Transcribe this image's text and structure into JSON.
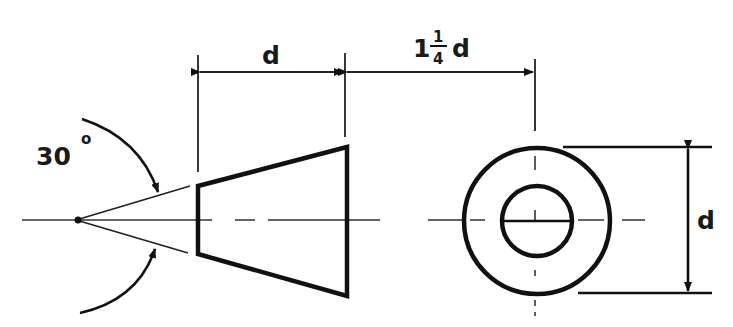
{
  "figure": {
    "labels": {
      "angle": "30",
      "angle_unit": "o",
      "length_dim": "d",
      "offset_whole": "1",
      "offset_num": "1",
      "offset_den": "4",
      "offset_var": "d",
      "diameter_dim": "d"
    },
    "dimensions": {
      "cone_angle_deg": 30,
      "cone_length": "d",
      "view_spacing": "1 1/4 d",
      "outer_diameter": "d"
    },
    "colors": {
      "ink": "#111111",
      "background": "#ffffff"
    }
  }
}
